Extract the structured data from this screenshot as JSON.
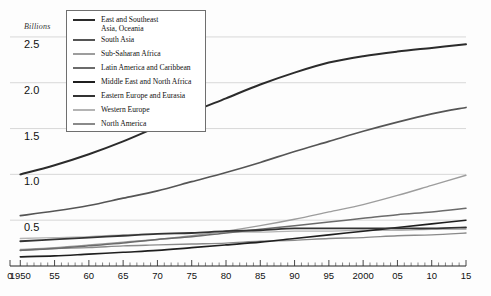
{
  "figure": {
    "cropped_title_fragment": "",
    "background": "#fdfdfd"
  },
  "chart_data": {
    "type": "line",
    "title": "",
    "subtitle": "",
    "xlabel": "",
    "ylabel": "Billions",
    "ylim": [
      0,
      2.75
    ],
    "xlim": [
      1948.5,
      2015
    ],
    "grid": "horizontal",
    "legend_position": "top-left-inside",
    "x": [
      1950,
      1955,
      1960,
      1965,
      1970,
      1975,
      1980,
      1985,
      1990,
      1995,
      2000,
      2005,
      2010,
      2015
    ],
    "xticks": [
      {
        "value": 0,
        "label": "0"
      },
      {
        "value": 1950,
        "label": "1950"
      },
      {
        "value": 1955,
        "label": "55"
      },
      {
        "value": 1960,
        "label": "60"
      },
      {
        "value": 1965,
        "label": "65"
      },
      {
        "value": 1970,
        "label": "70"
      },
      {
        "value": 1975,
        "label": "75"
      },
      {
        "value": 1980,
        "label": "80"
      },
      {
        "value": 1985,
        "label": "85"
      },
      {
        "value": 1990,
        "label": "90"
      },
      {
        "value": 1995,
        "label": "95"
      },
      {
        "value": 2000,
        "label": "2000"
      },
      {
        "value": 2005,
        "label": "05"
      },
      {
        "value": 2010,
        "label": "10"
      },
      {
        "value": 2015,
        "label": "15"
      }
    ],
    "yticks": [
      {
        "value": 0.5,
        "label": "0.5"
      },
      {
        "value": 1.0,
        "label": "1.0"
      },
      {
        "value": 1.5,
        "label": "1.5"
      },
      {
        "value": 2.0,
        "label": "2.0"
      },
      {
        "value": 2.5,
        "label": "2.5"
      }
    ],
    "series": [
      {
        "name": "East and Southeast\nAsia, Oceania",
        "legend_label": "East and Southeast\nAsia, Oceania",
        "color": "#2b2b2b",
        "width": 2.0,
        "values": [
          1.0,
          1.1,
          1.22,
          1.36,
          1.52,
          1.68,
          1.83,
          1.98,
          2.11,
          2.22,
          2.29,
          2.34,
          2.38,
          2.42
        ]
      },
      {
        "name": "South Asia",
        "legend_label": "South Asia",
        "color": "#555555",
        "width": 1.7,
        "values": [
          0.55,
          0.6,
          0.66,
          0.74,
          0.82,
          0.92,
          1.02,
          1.13,
          1.25,
          1.36,
          1.47,
          1.57,
          1.66,
          1.73
        ]
      },
      {
        "name": "Sub-Saharan Africa",
        "legend_label": "Sub-Saharan Africa",
        "color": "#9d9d9d",
        "width": 1.4,
        "values": [
          0.18,
          0.2,
          0.23,
          0.26,
          0.29,
          0.33,
          0.38,
          0.44,
          0.51,
          0.59,
          0.67,
          0.77,
          0.88,
          0.99
        ]
      },
      {
        "name": "Latin America and Caribbean",
        "legend_label": "Latin America and Caribbean",
        "color": "#6b6b6b",
        "width": 1.5,
        "values": [
          0.17,
          0.19,
          0.22,
          0.25,
          0.29,
          0.32,
          0.36,
          0.4,
          0.44,
          0.48,
          0.52,
          0.56,
          0.59,
          0.63
        ]
      },
      {
        "name": "Middle East and North Africa",
        "legend_label": "Middle East and North Africa",
        "color": "#1f1f1f",
        "width": 1.6,
        "values": [
          0.1,
          0.11,
          0.13,
          0.15,
          0.17,
          0.2,
          0.23,
          0.26,
          0.3,
          0.34,
          0.38,
          0.42,
          0.46,
          0.5
        ]
      },
      {
        "name": "Eastern Europe and Eurasia",
        "legend_label": "Eastern Europe and Eurasia",
        "color": "#333333",
        "width": 1.8,
        "values": [
          0.27,
          0.29,
          0.31,
          0.33,
          0.35,
          0.36,
          0.38,
          0.39,
          0.41,
          0.41,
          0.41,
          0.41,
          0.41,
          0.42
        ]
      },
      {
        "name": "Western Europe",
        "legend_label": "Western Europe",
        "color": "#b4b4b4",
        "width": 1.3,
        "values": [
          0.3,
          0.31,
          0.32,
          0.34,
          0.35,
          0.36,
          0.37,
          0.37,
          0.38,
          0.38,
          0.39,
          0.39,
          0.4,
          0.4
        ]
      },
      {
        "name": "North America",
        "legend_label": "North America",
        "color": "#8a8a8a",
        "width": 1.4,
        "values": [
          0.17,
          0.19,
          0.2,
          0.22,
          0.23,
          0.24,
          0.25,
          0.27,
          0.28,
          0.3,
          0.31,
          0.33,
          0.34,
          0.36
        ]
      }
    ]
  }
}
